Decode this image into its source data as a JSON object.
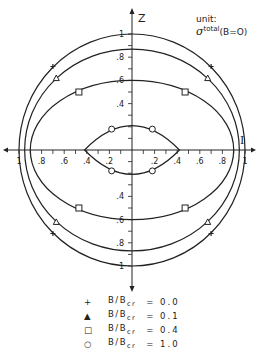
{
  "chart_data": {
    "type": "line",
    "title": "",
    "xlabel": "I",
    "ylabel": "Z",
    "unit_label": "unit:",
    "unit_expr": "σ_{-ν}^{total}(B=O)",
    "xlim": [
      -1,
      1
    ],
    "ylim": [
      -1,
      1
    ],
    "grid": false,
    "x_tick_labels": [
      "1",
      ".8",
      ".6",
      ".4",
      ".2",
      ".2",
      ".4",
      ".6",
      ".8",
      "1"
    ],
    "y_tick_labels": [
      "1",
      ".8",
      ".6",
      ".4",
      ".4",
      ".6",
      ".8",
      "1"
    ],
    "legend_position": "bottom",
    "series": [
      {
        "name": "B/Bcr = 0.0",
        "marker": "+",
        "shape": "circle",
        "z_max": 1.0,
        "x_max": 1.0,
        "marker_points": [
          [
            -0.7,
            0.72
          ],
          [
            0.7,
            0.72
          ],
          [
            -0.7,
            -0.72
          ],
          [
            0.7,
            -0.72
          ]
        ]
      },
      {
        "name": "B/Bcr = 0.1",
        "marker": "triangle",
        "shape": "ellipse",
        "z_max": 0.87,
        "x_max": 0.95,
        "marker_points": [
          [
            -0.67,
            0.62
          ],
          [
            0.67,
            0.62
          ],
          [
            -0.67,
            -0.62
          ],
          [
            0.67,
            -0.62
          ]
        ]
      },
      {
        "name": "B/Bcr = 0.4",
        "marker": "square",
        "shape": "ellipse",
        "z_max": 0.6,
        "x_max": 0.9,
        "marker_points": [
          [
            -0.47,
            0.5
          ],
          [
            0.47,
            0.5
          ],
          [
            -0.47,
            -0.5
          ],
          [
            0.47,
            -0.5
          ]
        ]
      },
      {
        "name": "B/Bcr = 1.0",
        "marker": "circle",
        "shape": "lens",
        "z_max": 0.21,
        "x_max": 0.42,
        "marker_points": [
          [
            -0.18,
            0.18
          ],
          [
            0.18,
            0.18
          ],
          [
            -0.18,
            -0.18
          ],
          [
            0.18,
            -0.18
          ]
        ]
      }
    ]
  },
  "legend": [
    {
      "marker": "+",
      "label": "B/B",
      "sub": "cr",
      "value": "= 0.0"
    },
    {
      "marker": "▲",
      "label": "B/B",
      "sub": "cr",
      "value": "= 0.1"
    },
    {
      "marker": "□",
      "label": "B/B",
      "sub": "cr",
      "value": "= 0.4"
    },
    {
      "marker": "○",
      "label": "B/B",
      "sub": "cr",
      "value": "= 1.0"
    }
  ],
  "unit": {
    "label": "unit:",
    "sym": "σ",
    "sup": "total",
    "sub": "-ν",
    "cond": "(B=O)"
  },
  "axes": {
    "x_label": "I",
    "z_label": "Z"
  }
}
